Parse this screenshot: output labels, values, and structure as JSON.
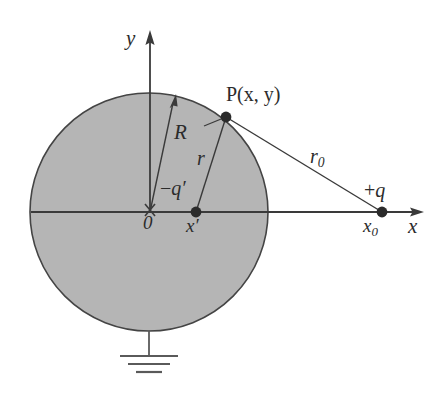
{
  "figure": {
    "background_color": "#ffffff",
    "sphere_fill_color": "#b5b5b5",
    "stroke_color": "#3a3a3a",
    "label_color": "#2b2b2b"
  },
  "axes": {
    "y_label": "y",
    "x_label": "x",
    "origin_label": "0",
    "origin_marker": "cross-mark"
  },
  "sphere": {
    "center": {
      "x": 149,
      "y": 212
    },
    "radius": 119,
    "radius_label": "R",
    "ground_symbol": "earth-ground"
  },
  "points": [
    {
      "id": "field-point",
      "label": "P(x, y)",
      "label_main": "P(",
      "x": 226,
      "y": 117,
      "marker": "filled-dot"
    },
    {
      "id": "image-charge",
      "label": "−q′",
      "position_label": "x′",
      "x": 196,
      "y": 212,
      "marker": "filled-dot"
    },
    {
      "id": "source-charge",
      "label": "+q",
      "position_label": "x",
      "position_label_sub": "0",
      "x": 382,
      "y": 212,
      "marker": "filled-dot"
    }
  ],
  "segments": [
    {
      "id": "radius-R",
      "label": "R",
      "from": "origin",
      "to": "sphere-surface",
      "arrow": true
    },
    {
      "id": "distance-r",
      "label": "r",
      "from": "image-charge",
      "to": "field-point",
      "arrow": false
    },
    {
      "id": "distance-r0",
      "label": "r",
      "label_sub": "0",
      "from": "field-point",
      "to": "source-charge",
      "arrow": false
    }
  ],
  "labels": {
    "y_axis": "y",
    "x_axis": "x",
    "origin": "0",
    "R": "R",
    "r": "r",
    "r0_base": "r",
    "r0_sub": "0",
    "P_prefix": "P(",
    "P_x": "x",
    "P_comma": ", ",
    "P_y": "y",
    "P_suffix": ")",
    "neg_q_sign": "−",
    "neg_q_letter": "q",
    "neg_q_prime": "′",
    "x_prime_letter": "x",
    "x_prime_mark": "′",
    "plus_q_sign": "+",
    "plus_q_letter": "q",
    "x0_letter": "x",
    "x0_sub": "0"
  }
}
